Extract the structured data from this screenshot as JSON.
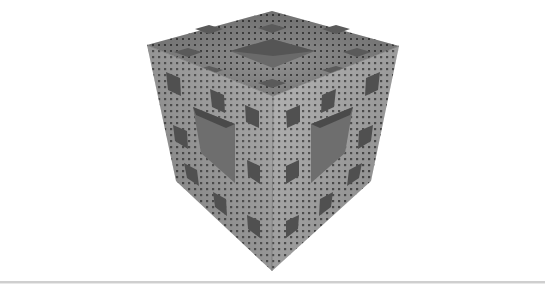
{
  "image": {
    "subject": "Menger sponge fractal cube",
    "caption": "",
    "colors": {
      "background": "#ffffff",
      "face_light": "#a9a9a9",
      "face_mid": "#8c8c8c",
      "face_dark": "#727272",
      "hole": "#3e3e3e",
      "divider": "#cfcfcf"
    }
  }
}
